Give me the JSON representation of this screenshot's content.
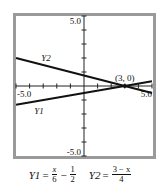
{
  "chart_data": {
    "type": "line",
    "title": "",
    "xlabel": "",
    "ylabel": "",
    "xlim": [
      -5,
      5
    ],
    "ylim": [
      -5,
      5
    ],
    "x_tick_step": 1,
    "y_tick_step": 1,
    "grid": false,
    "tick_labels": {
      "x_min": "-5.0",
      "x_max": "5.0",
      "y_min": "-5.0",
      "y_max": "5.0"
    },
    "series": [
      {
        "name": "Y1",
        "expression": "x/6 - 1/2",
        "x": [
          -5,
          5
        ],
        "values": [
          -1.333,
          0.333
        ]
      },
      {
        "name": "Y2",
        "expression": "(3 - x)/4",
        "x": [
          -5,
          5
        ],
        "values": [
          2.0,
          -0.5
        ]
      }
    ],
    "annotations": [
      {
        "text": "(3, 0)",
        "x": 3,
        "y": 0,
        "type": "intersection-point"
      },
      {
        "text": "Y2",
        "x": -2.8,
        "y": 1.8,
        "type": "series-label"
      },
      {
        "text": "Y1",
        "x": -3.3,
        "y": -2.0,
        "type": "series-label"
      }
    ],
    "legend": "none"
  },
  "formula": {
    "y1_name": "Y1",
    "eq": "=",
    "y1_num": "x",
    "y1_den": "6",
    "minus": "−",
    "y1_num2": "1",
    "y1_den2": "2",
    "y2_name": "Y2",
    "y2_num": "3 − x",
    "y2_den": "4"
  },
  "colors": {
    "frame": "#9a9a9a",
    "line": "#111111",
    "axis": "#222222",
    "background": "#ffffff"
  }
}
